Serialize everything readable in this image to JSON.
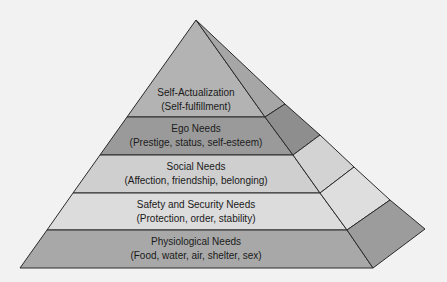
{
  "diagram": {
    "type": "pyramid",
    "levels": [
      {
        "title": "Self-Actualization",
        "subtitle": "(Self-fulfillment)",
        "front_color": "#b3b3b3",
        "side_color": "#a6a6a6"
      },
      {
        "title": "Ego Needs",
        "subtitle": "(Prestige, status, self-esteem)",
        "front_color": "#9a9a9a",
        "side_color": "#8e8e8e"
      },
      {
        "title": "Social Needs",
        "subtitle": "(Affection, friendship, belonging)",
        "front_color": "#cfcfcf",
        "side_color": "#d3d3d3"
      },
      {
        "title": "Safety and Security Needs",
        "subtitle": "(Protection, order, stability)",
        "front_color": "#dcdcdc",
        "side_color": "#dedede"
      },
      {
        "title": "Physiological Needs",
        "subtitle": "(Food, water, air, shelter, sex)",
        "front_color": "#a8a8a8",
        "side_color": "#9c9c9c"
      }
    ],
    "outline_color": "#2a2a2a",
    "background_color": "#f2f2f2"
  }
}
